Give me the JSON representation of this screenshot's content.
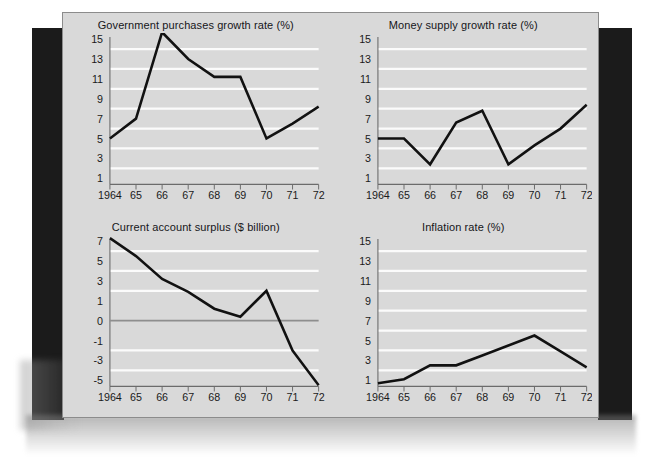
{
  "figure": {
    "background_color": "#d9d9d9",
    "gridline_color": "#fbfbfb",
    "series_color": "#111111",
    "panel_count": 4
  },
  "chart_data": [
    {
      "type": "line",
      "title": "Government purchases growth rate (%)",
      "xlabel": "",
      "ylabel": "",
      "categories": [
        "1964",
        "65",
        "66",
        "67",
        "68",
        "69",
        "70",
        "71",
        "72"
      ],
      "x": [
        1964,
        1965,
        1966,
        1967,
        1968,
        1969,
        1970,
        1971,
        1972
      ],
      "values": [
        5.0,
        7.0,
        15.7,
        13.0,
        11.2,
        11.2,
        5.0,
        6.5,
        8.2
      ],
      "ytick_labels": [
        "15",
        "13",
        "11",
        "9",
        "7",
        "5",
        "3",
        "1"
      ],
      "yticks": [
        15,
        13,
        11,
        9,
        7,
        5,
        3,
        1
      ],
      "gridline_values": [
        14,
        12,
        10,
        8,
        6,
        4,
        2
      ],
      "ylim": [
        0,
        16
      ],
      "grid": true,
      "legend": "none"
    },
    {
      "type": "line",
      "title": "Money supply growth rate (%)",
      "xlabel": "",
      "ylabel": "",
      "categories": [
        "1964",
        "65",
        "66",
        "67",
        "68",
        "69",
        "70",
        "71",
        "72"
      ],
      "x": [
        1964,
        1965,
        1966,
        1967,
        1968,
        1969,
        1970,
        1971,
        1972
      ],
      "values": [
        5.0,
        5.0,
        2.4,
        6.6,
        7.8,
        2.4,
        4.3,
        6.0,
        8.4
      ],
      "ytick_labels": [
        "15",
        "13",
        "11",
        "9",
        "7",
        "5",
        "3",
        "1"
      ],
      "yticks": [
        15,
        13,
        11,
        9,
        7,
        5,
        3,
        1
      ],
      "gridline_values": [
        14,
        12,
        10,
        8,
        6,
        4,
        2
      ],
      "ylim": [
        0,
        16
      ],
      "grid": true,
      "legend": "none"
    },
    {
      "type": "line",
      "title": "Current account surplus ($ billion)",
      "xlabel": "",
      "ylabel": "",
      "categories": [
        "1964",
        "65",
        "66",
        "67",
        "68",
        "69",
        "70",
        "71",
        "72"
      ],
      "x": [
        1964,
        1965,
        1966,
        1967,
        1968,
        1969,
        1970,
        1971,
        1972
      ],
      "values": [
        7.3,
        5.5,
        3.2,
        1.9,
        0.6,
        0.2,
        2.0,
        -2.0,
        -5.5
      ],
      "ytick_labels": [
        "7",
        "5",
        "3",
        "1",
        "0",
        "-1",
        "-3",
        "-5"
      ],
      "yticks": [
        7,
        5,
        3,
        1,
        0,
        -1,
        -3,
        -5
      ],
      "gridline_values": [
        6,
        4,
        2,
        -2,
        -4
      ],
      "zero_line": 0,
      "ylim": [
        -6,
        8
      ],
      "grid": true,
      "legend": "none"
    },
    {
      "type": "line",
      "title": "Inflation rate (%)",
      "xlabel": "",
      "ylabel": "",
      "categories": [
        "1964",
        "65",
        "66",
        "67",
        "68",
        "69",
        "70",
        "71",
        "72"
      ],
      "x": [
        1964,
        1965,
        1966,
        1967,
        1968,
        1969,
        1970,
        1971,
        1972
      ],
      "values": [
        0.7,
        1.1,
        2.5,
        2.5,
        3.5,
        4.5,
        5.5,
        3.9,
        2.3
      ],
      "ytick_labels": [
        "15",
        "13",
        "11",
        "9",
        "7",
        "5",
        "3",
        "1"
      ],
      "yticks": [
        15,
        13,
        11,
        9,
        7,
        5,
        3,
        1
      ],
      "gridline_values": [
        14,
        12,
        10,
        8,
        6,
        4,
        2
      ],
      "ylim": [
        0,
        16
      ],
      "grid": true,
      "legend": "none"
    }
  ]
}
